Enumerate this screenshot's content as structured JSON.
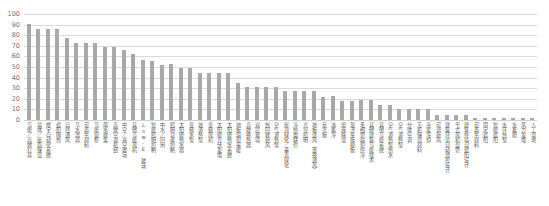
{
  "chart_data": {
    "type": "bar",
    "title": "",
    "xlabel": "",
    "ylabel": "",
    "ylim": [
      0,
      100
    ],
    "yticks": [
      0,
      10,
      20,
      30,
      40,
      50,
      60,
      70,
      80,
      90,
      100
    ],
    "grid": true,
    "legend": false,
    "bar_color": "#a9a9a9",
    "gridline_color": "#d9d9d9",
    "orientation": "vertical",
    "sorted": "descending",
    "categories": [
      "节能／高效灯具",
      "墙体／屋面保温",
      "楼宇自动化系统",
      "遮阳隔热",
      "自然通风",
      "节水器具",
      "可再生材料",
      "节能窗框",
      "雨水收集",
      "高效空调机组",
      "中空／真空玻璃",
      "其他节能风机",
      "Low-E 玻璃",
      "智能照明控制",
      "中水／回用",
      "照明功率控制",
      "太阳能热水器",
      "变频水泵",
      "地源热泵",
      "变频风机",
      "太阳能光伏发电",
      "太阳能热水系统",
      "地板辐射采暖",
      "高效换热器",
      "双层幕墙",
      "热回收新风",
      "空气源热泵",
      "屋顶绿化／垂直绿化",
      "冷热电联供",
      "光导照明",
      "地板送风（置换通风）",
      "反光板",
      "冰蓄冷",
      "溶液除湿",
      "现浇免拆模板",
      "毛细管辐射供冷",
      "其他建筑节能技术",
      "其他节能系统",
      "空气源热泵热水",
      "空气源热泵",
      "分体空调",
      "无机保温材料",
      "蒸发冷却",
      "可调新风",
      "建筑环境自动监控设计",
      "干式风机盘管",
      "建筑外墙自遮阳设计",
      "可再生材料",
      "固定遮阳",
      "智能遮阳",
      "水环热泵",
      "水蓄能",
      "风力发电",
      "人工湿地"
    ],
    "values": [
      91,
      86,
      86,
      86,
      77,
      73,
      73,
      73,
      69,
      69,
      66,
      62,
      57,
      56,
      52,
      53,
      49,
      49,
      44,
      44,
      44,
      44,
      35,
      31,
      31,
      31,
      31,
      27,
      27,
      27,
      27,
      22,
      23,
      18,
      18,
      19,
      19,
      14,
      14,
      10,
      10,
      10,
      10,
      5,
      5,
      5,
      5,
      2,
      2,
      2,
      2,
      2,
      2,
      2
    ]
  }
}
